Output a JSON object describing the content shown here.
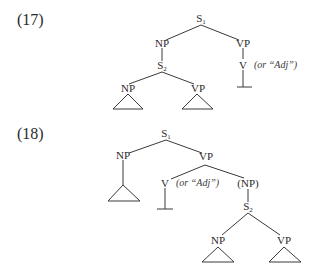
{
  "examples": [
    {
      "number": "(17)",
      "nodes": {
        "s1": {
          "label": "S",
          "sub": "1"
        },
        "np": {
          "label": "NP"
        },
        "vp": {
          "label": "VP"
        },
        "s2": {
          "label": "S",
          "sub": "2"
        },
        "v": {
          "label": "V"
        },
        "np2": {
          "label": "NP"
        },
        "vp2": {
          "label": "VP"
        }
      },
      "annotation": "(or “Adj”)"
    },
    {
      "number": "(18)",
      "nodes": {
        "s1": {
          "label": "S",
          "sub": "1"
        },
        "np": {
          "label": "NP"
        },
        "vp": {
          "label": "VP"
        },
        "v": {
          "label": "V"
        },
        "np_opt": {
          "label": "(NP)"
        },
        "s2": {
          "label": "S",
          "sub": "2"
        },
        "np2": {
          "label": "NP"
        },
        "vp2": {
          "label": "VP"
        }
      },
      "annotation": "(or “Adj”)"
    }
  ],
  "colors": {
    "ink": "#2a2a2a",
    "background": "#ffffff"
  }
}
